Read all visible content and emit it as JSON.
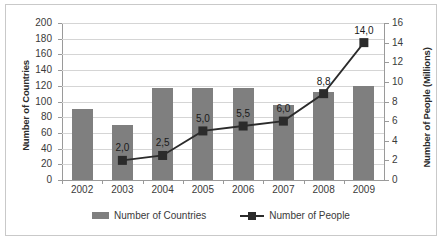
{
  "chart_data": {
    "type": "bar",
    "title": "",
    "xlabel": "",
    "ylabel": "Number of Countries",
    "y2label": "Number of People (Millions)",
    "categories": [
      "2002",
      "2003",
      "2004",
      "2005",
      "2006",
      "2007",
      "2008",
      "2009"
    ],
    "ylim": [
      0,
      200
    ],
    "y2lim": [
      0,
      16
    ],
    "yticks": [
      "0",
      "20",
      "40",
      "60",
      "80",
      "100",
      "120",
      "140",
      "160",
      "180",
      "200"
    ],
    "y2ticks": [
      "0",
      "2",
      "4",
      "6",
      "8",
      "10",
      "12",
      "14",
      "16"
    ],
    "grid": true,
    "legend_position": "bottom",
    "series": [
      {
        "name": "Number of Countries",
        "type": "bar",
        "axis": "left",
        "color": "#7f7f7f",
        "values": [
          90,
          70,
          117,
          117,
          117,
          95,
          112,
          120
        ]
      },
      {
        "name": "Number of People",
        "type": "line",
        "axis": "right",
        "color": "#2b2b2b",
        "values": [
          null,
          2.0,
          2.5,
          5.0,
          5.5,
          6.0,
          8.8,
          14.0
        ],
        "data_labels": [
          "",
          "2,0",
          "2,5",
          "5,0",
          "5,5",
          "6,0",
          "8,8",
          "14,0"
        ]
      }
    ]
  },
  "legend": {
    "items": [
      {
        "label": "Number of Countries",
        "marker": "square-swatch"
      },
      {
        "label": "Number of People",
        "marker": "line-with-square-marker"
      }
    ]
  }
}
